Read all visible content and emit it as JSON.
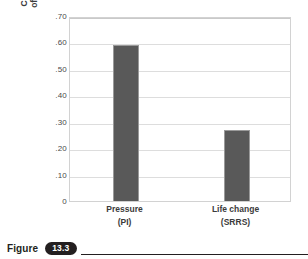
{
  "chart_data": {
    "type": "bar",
    "title": "",
    "xlabel": "",
    "ylabel_line1": "Correlation with total index",
    "ylabel_line2": "of psychological symptoms",
    "categories": [
      "Pressure",
      "Life change"
    ],
    "category_sublabels": [
      "(PI)",
      "(SRRS)"
    ],
    "values": [
      0.59,
      0.27
    ],
    "ylim": [
      0,
      0.7
    ],
    "yticks": [
      0.7,
      0.6,
      0.5,
      0.4,
      0.3,
      0.2,
      0.1,
      0
    ],
    "ytick_labels": [
      ".70",
      ".60",
      ".50",
      ".40",
      ".30",
      ".20",
      ".10",
      "0"
    ],
    "grid": true,
    "legend": "none",
    "bar_color": "#595959",
    "bar_edge_color": "#9a9a9a",
    "gridline_color": "#dddddd"
  },
  "caption": {
    "word": "Figure",
    "number": "13.3"
  }
}
